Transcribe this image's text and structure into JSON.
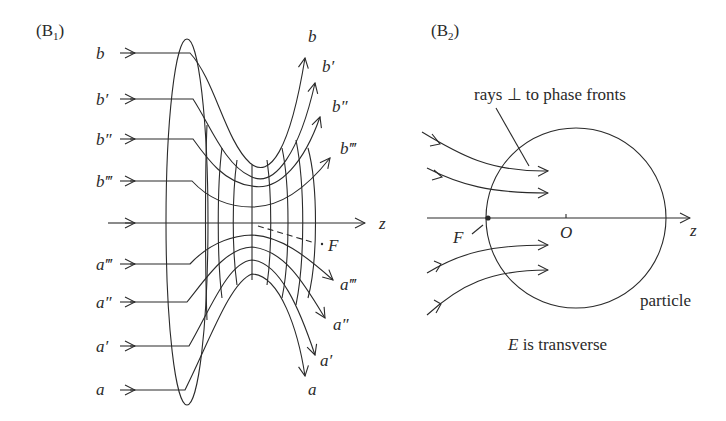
{
  "panel_b1": {
    "label": "(B",
    "label_sub": "1",
    "label_close": ")",
    "incoming_labels_top": [
      "b",
      "b′",
      "b″",
      "b‴"
    ],
    "incoming_labels_bottom": [
      "a‴",
      "a″",
      "a′",
      "a"
    ],
    "outgoing_labels_top": [
      "b",
      "b′",
      "b″",
      "b‴"
    ],
    "outgoing_labels_bottom": [
      "a‴",
      "a″",
      "a′",
      "a"
    ],
    "axis_label": "z",
    "focus_label": "F"
  },
  "panel_b2": {
    "label": "(B",
    "label_sub": "2",
    "label_close": ")",
    "annotation": "rays ⊥ to phase fronts",
    "focus_label": "F",
    "origin_label": "O",
    "axis_label": "z",
    "particle_label": "particle",
    "caption_var": "E",
    "caption_rest": " is transverse"
  }
}
